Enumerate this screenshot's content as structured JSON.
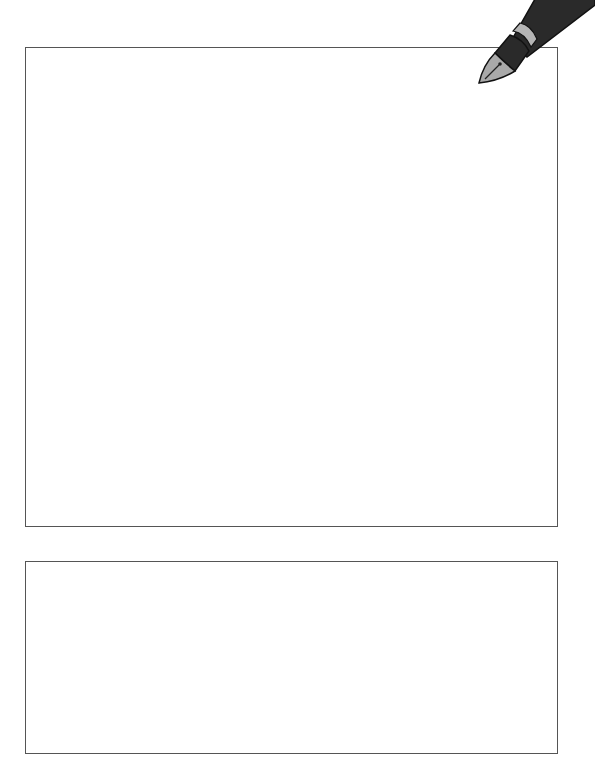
{
  "boxes": [
    {
      "id": "main-writing-area",
      "text": ""
    },
    {
      "id": "secondary-writing-area",
      "text": ""
    }
  ],
  "icons": {
    "pen": "fountain-pen-icon"
  },
  "colors": {
    "border": "#555555",
    "pen_body": "#2a2a2a",
    "pen_band": "#b5b5b5",
    "nib": "#a9a9a9"
  }
}
